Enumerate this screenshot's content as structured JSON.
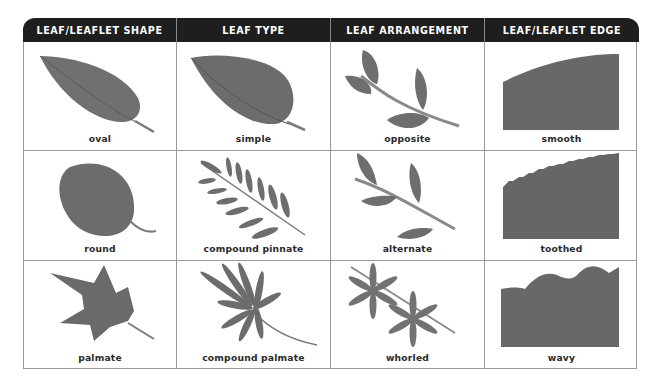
{
  "headers": [
    "LEAF/LEAFLET SHAPE",
    "LEAF TYPE",
    "LEAF ARRANGEMENT",
    "LEAF/LEAFLET EDGE"
  ],
  "rows": [
    {
      "shape": {
        "label": "oval",
        "icon": "oval-leaf-icon"
      },
      "type": {
        "label": "simple",
        "icon": "simple-leaf-icon"
      },
      "arrangement": {
        "label": "opposite",
        "icon": "opposite-arrangement-icon"
      },
      "edge": {
        "label": "smooth",
        "icon": "smooth-edge-icon"
      }
    },
    {
      "shape": {
        "label": "round",
        "icon": "round-leaf-icon"
      },
      "type": {
        "label": "compound pinnate",
        "icon": "compound-pinnate-leaf-icon"
      },
      "arrangement": {
        "label": "alternate",
        "icon": "alternate-arrangement-icon"
      },
      "edge": {
        "label": "toothed",
        "icon": "toothed-edge-icon"
      }
    },
    {
      "shape": {
        "label": "palmate",
        "icon": "palmate-leaf-icon"
      },
      "type": {
        "label": "compound palmate",
        "icon": "compound-palmate-leaf-icon"
      },
      "arrangement": {
        "label": "whorled",
        "icon": "whorled-arrangement-icon"
      },
      "edge": {
        "label": "wavy",
        "icon": "wavy-edge-icon"
      }
    }
  ],
  "colors": {
    "header_bg": "#1e1e1e",
    "header_text": "#ffffff",
    "grid_line": "#9a9a9a",
    "leaf_fill": "#6e6e6e",
    "leaf_dark": "#555555",
    "stem": "#8a8a8a"
  }
}
